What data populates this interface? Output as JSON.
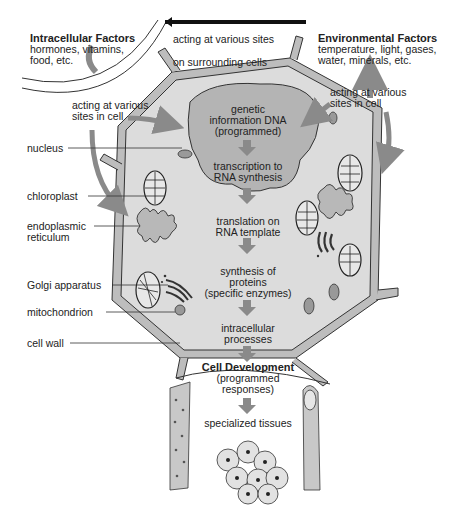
{
  "diagram": {
    "intracellular_factors": {
      "title": "Intracellular Factors",
      "line1": "hormones, vitamins,",
      "line2": "food, etc."
    },
    "environmental_factors": {
      "title": "Environmental Factors",
      "line1": "temperature, light, gases,",
      "line2": "water, minerals, etc."
    },
    "top_arrow": {
      "above": "acting at various sites",
      "below": "on surrounding cells"
    },
    "left_action": {
      "line1": "acting at various",
      "line2": "sites in cell"
    },
    "right_action": {
      "line1": "acting at various",
      "line2": "sites in cell"
    },
    "flow_steps": [
      {
        "lines": [
          "genetic",
          "information DNA",
          "(programmed)"
        ]
      },
      {
        "lines": [
          "transcription to",
          "RNA synthesis"
        ]
      },
      {
        "lines": [
          "translation on",
          "RNA template"
        ]
      },
      {
        "lines": [
          "synthesis of",
          "proteins",
          "(specific enzymes)"
        ]
      },
      {
        "lines": [
          "intracellular",
          "processes"
        ]
      }
    ],
    "cell_development": {
      "title": "Cell Development",
      "line1": "(programmed",
      "line2": "responses)"
    },
    "specialized_tissues": "specialized tissues",
    "labels": {
      "nucleus": "nucleus",
      "chloroplast": "chloroplast",
      "endoplasmic_1": "endoplasmic",
      "endoplasmic_2": "reticulum",
      "golgi": "Golgi apparatus",
      "mitochondrion": "mitochondrion",
      "cell_wall": "cell wall"
    },
    "colors": {
      "cell_fill": "#dcdcdc",
      "wall_fill": "#bdbdbd",
      "nucleus_fill": "#b4b4b4",
      "arrow_gray": "#8a8a8a",
      "line": "#333333"
    }
  }
}
